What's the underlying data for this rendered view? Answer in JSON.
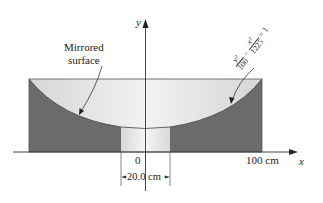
{
  "diagram": {
    "type": "cross-section of hyperbolic mirror",
    "axes": {
      "x_label": "x",
      "y_label": "y",
      "origin_label": "0"
    },
    "labels": {
      "mirrored_surface_line1": "Mirrored",
      "mirrored_surface_line2": "surface",
      "x_tick_100": "100 cm",
      "opening_width": "20.0 cm"
    },
    "equation": {
      "term1_num": "y²",
      "term1_den": "100",
      "minus": "−",
      "term2_num": "x²",
      "term2_den": "1225",
      "equals": "= 1"
    },
    "colors": {
      "solid_fill": "#6b6b6b",
      "surface_fill": "#e4e4e4",
      "opening_fill": "#efefef",
      "line": "#333333"
    }
  }
}
